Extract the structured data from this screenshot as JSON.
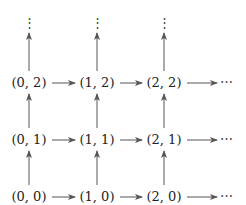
{
  "diagram": {
    "title": "",
    "nodes": [
      {
        "id": "0,0",
        "label": "(0, 0)",
        "col": 0,
        "row": 0
      },
      {
        "id": "1,0",
        "label": "(1, 0)",
        "col": 1,
        "row": 0
      },
      {
        "id": "2,0",
        "label": "(2, 0)",
        "col": 2,
        "row": 0
      },
      {
        "id": "0,1",
        "label": "(0, 1)",
        "col": 0,
        "row": 1
      },
      {
        "id": "1,1",
        "label": "(1, 1)",
        "col": 1,
        "row": 1
      },
      {
        "id": "2,1",
        "label": "(2, 1)",
        "col": 2,
        "row": 1
      },
      {
        "id": "0,2",
        "label": "(0, 2)",
        "col": 0,
        "row": 2
      },
      {
        "id": "1,2",
        "label": "(1, 2)",
        "col": 1,
        "row": 2
      },
      {
        "id": "2,2",
        "label": "(2, 2)",
        "col": 2,
        "row": 2
      }
    ],
    "edges": [
      {
        "from": "0,0",
        "to": "1,0"
      },
      {
        "from": "1,0",
        "to": "2,0"
      },
      {
        "from": "0,1",
        "to": "1,1"
      },
      {
        "from": "1,1",
        "to": "2,1"
      },
      {
        "from": "0,2",
        "to": "1,2"
      },
      {
        "from": "1,2",
        "to": "2,2"
      },
      {
        "from": "0,0",
        "to": "0,1"
      },
      {
        "from": "0,1",
        "to": "0,2"
      },
      {
        "from": "1,0",
        "to": "1,1"
      },
      {
        "from": "1,1",
        "to": "1,2"
      },
      {
        "from": "2,0",
        "to": "2,1"
      },
      {
        "from": "2,1",
        "to": "2,2"
      }
    ],
    "continuation_right": "⋯",
    "continuation_up": "⋮"
  }
}
